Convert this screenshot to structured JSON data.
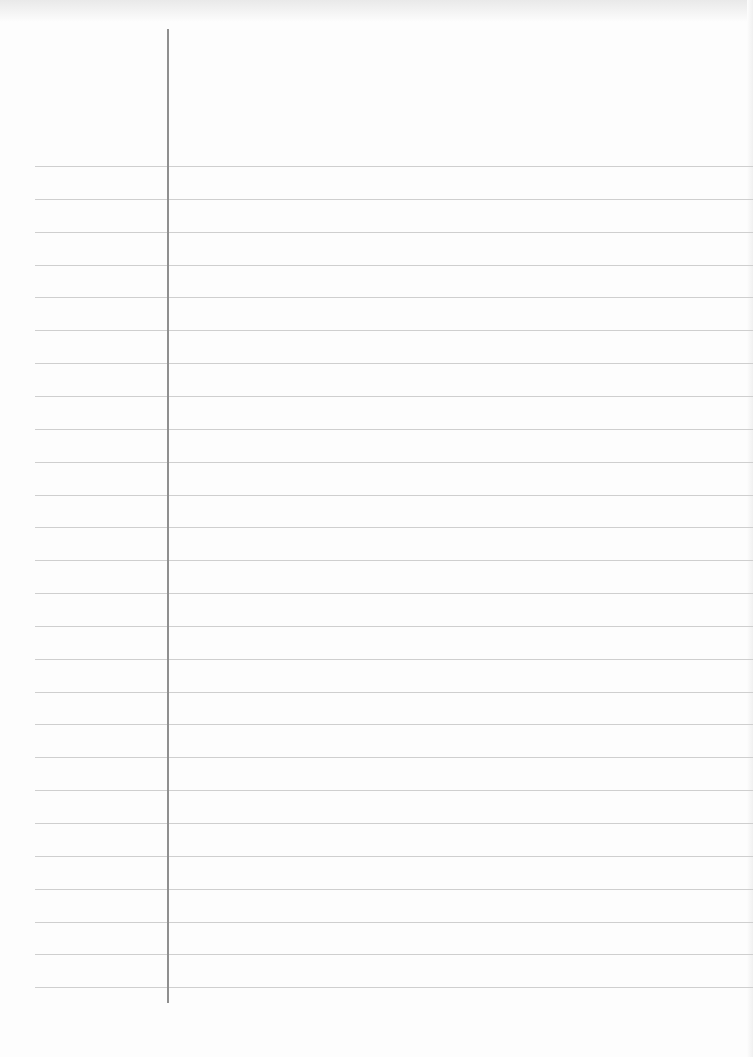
{
  "page": {
    "type": "lined-paper-sheet",
    "text_content": "",
    "background_color": "#fdfdfd",
    "rule_color": "#cfcfcf",
    "margin_line_color": "#8f8f8f"
  },
  "rules": {
    "count": 26,
    "first_y": 166,
    "spacing": 32.85,
    "left_x": 35
  },
  "margin_line": {
    "x": 167,
    "top_y": 29,
    "bottom_y": 1003
  }
}
